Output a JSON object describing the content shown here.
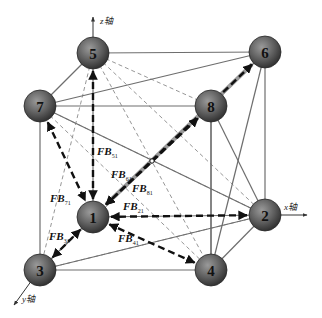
{
  "diagram": {
    "title": "",
    "axes": {
      "x": "x轴",
      "y": "y轴",
      "z": "z轴"
    },
    "nodes": [
      {
        "id": "1",
        "label": "1"
      },
      {
        "id": "2",
        "label": "2"
      },
      {
        "id": "3",
        "label": "3"
      },
      {
        "id": "4",
        "label": "4"
      },
      {
        "id": "5",
        "label": "5"
      },
      {
        "id": "6",
        "label": "6"
      },
      {
        "id": "7",
        "label": "7"
      },
      {
        "id": "8",
        "label": "8"
      }
    ],
    "solid_edges": [
      [
        "5",
        "6"
      ],
      [
        "5",
        "7"
      ],
      [
        "7",
        "8"
      ],
      [
        "6",
        "8"
      ],
      [
        "1",
        "2"
      ],
      [
        "1",
        "3"
      ],
      [
        "3",
        "4"
      ],
      [
        "2",
        "4"
      ],
      [
        "5",
        "1"
      ],
      [
        "6",
        "2"
      ],
      [
        "7",
        "3"
      ],
      [
        "8",
        "4"
      ],
      [
        "7",
        "6"
      ],
      [
        "7",
        "2"
      ],
      [
        "8",
        "2"
      ],
      [
        "8",
        "4"
      ],
      [
        "6",
        "4"
      ],
      [
        "3",
        "2"
      ]
    ],
    "dashed_edges": [
      [
        "5",
        "8"
      ],
      [
        "5",
        "2"
      ],
      [
        "5",
        "4"
      ],
      [
        "5",
        "3"
      ],
      [
        "7",
        "4"
      ],
      [
        "7",
        "2"
      ],
      [
        "3",
        "8"
      ],
      [
        "3",
        "2"
      ]
    ],
    "forces": [
      {
        "from": "5",
        "to": "1",
        "label": "FB",
        "sub": "51"
      },
      {
        "from": "7",
        "to": "1",
        "label": "FB",
        "sub": "71"
      },
      {
        "from": "6",
        "to": "1",
        "label": "FB",
        "sub": "61"
      },
      {
        "from": "8",
        "to": "1",
        "label": "FB",
        "sub": "81"
      },
      {
        "from": "2",
        "to": "1",
        "label": "FB",
        "sub": "21"
      },
      {
        "from": "4",
        "to": "1",
        "label": "FB",
        "sub": "41"
      },
      {
        "from": "3",
        "to": "1",
        "label": "FB",
        "sub": "31"
      }
    ],
    "colors": {
      "node_fill_light": "#8a8a8a",
      "node_fill_dark": "#3a3a3a",
      "edge": "#6e6e6e",
      "force": "#111111"
    }
  }
}
